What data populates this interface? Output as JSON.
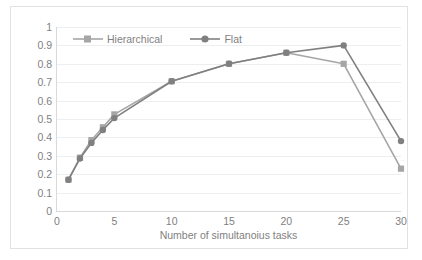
{
  "chart_data": {
    "type": "line",
    "title": "",
    "subtitle": "",
    "xlabel": "Number of simultanoius tasks",
    "ylabel": "",
    "x": [
      1,
      2,
      3,
      4,
      5,
      10,
      15,
      20,
      25,
      30
    ],
    "xlim": [
      0,
      30
    ],
    "ylim": [
      0,
      1
    ],
    "xticks": [
      0,
      5,
      10,
      15,
      20,
      25,
      30
    ],
    "xtick_labels": [
      "0",
      "5",
      "10",
      "15",
      "20",
      "25",
      "30"
    ],
    "yticks": [
      0,
      0.1,
      0.2,
      0.3,
      0.4,
      0.5,
      0.6,
      0.7,
      0.8,
      0.9,
      1
    ],
    "ytick_labels": [
      "0",
      "0.1",
      "0.2",
      "0.3",
      "0.4",
      "0.5",
      "0.6",
      "0.7",
      "0.8",
      "0.9",
      "1"
    ],
    "grid": "horizontal",
    "legend_position": "top-inside-left",
    "series": [
      {
        "name": "Hierarchical",
        "color": "#a6a6a6",
        "marker": "square",
        "values": [
          0.17,
          0.29,
          0.385,
          0.455,
          0.525,
          0.705,
          0.8,
          0.86,
          0.8,
          0.23
        ]
      },
      {
        "name": "Flat",
        "color": "#808080",
        "marker": "circle",
        "values": [
          0.17,
          0.285,
          0.37,
          0.44,
          0.505,
          0.705,
          0.8,
          0.86,
          0.9,
          0.38
        ]
      }
    ]
  },
  "axes": {
    "x_title": "Number of simultanoius tasks"
  },
  "legend": {
    "items": [
      {
        "label": "Hierarchical"
      },
      {
        "label": "Flat"
      }
    ]
  },
  "colors": {
    "series_hierarchical": "#a6a6a6",
    "series_flat": "#808080",
    "gridline": "#eceff1",
    "axis": "#d9d9d9",
    "text": "#7f7f7f",
    "frame": "#e2e2e2",
    "background": "#ffffff"
  }
}
